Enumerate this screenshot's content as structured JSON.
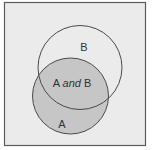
{
  "diagram": {
    "type": "venn",
    "colors": {
      "frame_fill": "#ebebeb",
      "frame_stroke": "#5a5a5a",
      "set_a_fill": "#c6c6c6",
      "circle_stroke": "#4a4a4a",
      "text": "#333333"
    },
    "sets": [
      {
        "name": "A",
        "label": "A",
        "shaded": true
      },
      {
        "name": "B",
        "label": "B",
        "shaded": false
      }
    ],
    "intersection": {
      "label_part1": "A ",
      "label_connector": "and",
      "label_part2": " B"
    }
  }
}
